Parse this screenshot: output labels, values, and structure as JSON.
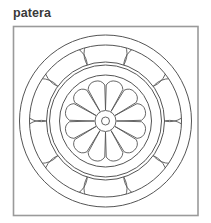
{
  "title": "patera",
  "colors": {
    "frame_stroke": "#9a9a9a",
    "line_stroke": "#555555",
    "title_text": "#3a3a3a",
    "background": "#ffffff"
  },
  "figure": {
    "frame": {
      "x": 13.5,
      "y": 26.5,
      "width": 184.5,
      "height": 189
    },
    "center": {
      "x": 105.5,
      "y": 121
    },
    "rings": [
      86,
      76,
      59,
      56,
      46
    ],
    "band": {
      "inner_r": 59,
      "outer_r": 76,
      "lobe_count": 10,
      "lobe_center_r": 67.5,
      "lobe_radius": 21.5,
      "start_angle_deg": -90
    },
    "rosette": {
      "petal_count": 12,
      "hub_outer_r": 10.5,
      "hub_inner_r": 4,
      "petal_tip_r": 45,
      "petal_base_r": 11
    }
  }
}
